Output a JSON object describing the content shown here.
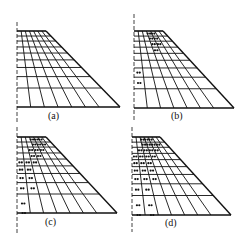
{
  "figure": {
    "panels": [
      {
        "id": "a",
        "label": "(a)",
        "stage_fraction": 0.0
      },
      {
        "id": "b",
        "label": "(b)",
        "stage_fraction": 0.33
      },
      {
        "id": "c",
        "label": "(c)",
        "stage_fraction": 0.66
      },
      {
        "id": "d",
        "label": "(d)",
        "stage_fraction": 1.0
      }
    ],
    "grid": {
      "columns": 7,
      "rows": 10
    },
    "colors": {
      "line": "#111111",
      "dot": "#111111",
      "background": "#ffffff"
    },
    "dots": {
      "a": [],
      "b": [
        [
          3,
          0
        ],
        [
          4,
          0
        ],
        [
          3,
          1
        ],
        [
          4,
          1
        ],
        [
          3,
          2
        ],
        [
          4,
          2
        ],
        [
          3,
          3
        ],
        [
          0,
          6
        ],
        [
          0,
          7
        ]
      ],
      "c": [
        [
          3,
          0
        ],
        [
          4,
          0
        ],
        [
          5,
          0
        ],
        [
          3,
          1
        ],
        [
          4,
          1
        ],
        [
          5,
          1
        ],
        [
          2,
          2
        ],
        [
          3,
          2
        ],
        [
          4,
          2
        ],
        [
          2,
          3
        ],
        [
          3,
          3
        ],
        [
          0,
          4
        ],
        [
          1,
          4
        ],
        [
          2,
          4
        ],
        [
          0,
          5
        ],
        [
          1,
          5
        ],
        [
          0,
          6
        ],
        [
          1,
          6
        ],
        [
          0,
          7
        ],
        [
          1,
          7
        ],
        [
          0,
          8
        ],
        [
          0,
          9
        ]
      ],
      "d": [
        [
          2,
          0
        ],
        [
          3,
          0
        ],
        [
          4,
          0
        ],
        [
          2,
          1
        ],
        [
          3,
          1
        ],
        [
          4,
          1
        ],
        [
          5,
          1
        ],
        [
          1,
          2
        ],
        [
          2,
          2
        ],
        [
          3,
          2
        ],
        [
          4,
          2
        ],
        [
          0,
          3
        ],
        [
          1,
          3
        ],
        [
          2,
          3
        ],
        [
          3,
          3
        ],
        [
          0,
          4
        ],
        [
          1,
          4
        ],
        [
          2,
          4
        ],
        [
          0,
          5
        ],
        [
          1,
          5
        ],
        [
          2,
          5
        ],
        [
          0,
          6
        ],
        [
          1,
          6
        ],
        [
          2,
          6
        ],
        [
          0,
          7
        ],
        [
          1,
          7
        ],
        [
          0,
          8
        ],
        [
          1,
          8
        ],
        [
          0,
          9
        ],
        [
          1,
          9
        ]
      ]
    }
  }
}
